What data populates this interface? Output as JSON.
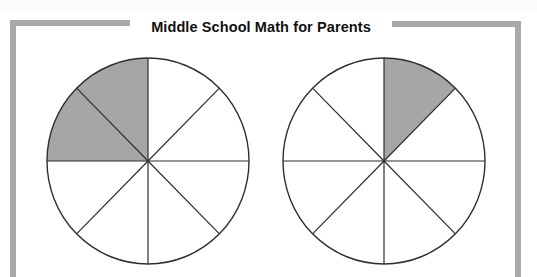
{
  "header": {
    "title": "Middle School Math for Parents"
  },
  "colors": {
    "frame": "#a9a9a9",
    "shade": "#a6a6a6",
    "line": "#2e2e2e",
    "unshaded": "#ffffff"
  },
  "figures": [
    {
      "name": "left-circle",
      "center": [
        148,
        161
      ],
      "radius": [
        101,
        103
      ],
      "sectors": 8,
      "shaded_sectors": [
        2,
        3
      ],
      "fraction": "2/8"
    },
    {
      "name": "right-circle",
      "center": [
        384,
        161
      ],
      "radius": [
        101,
        103
      ],
      "sectors": 8,
      "shaded_sectors": [
        1
      ],
      "fraction": "1/8"
    }
  ]
}
